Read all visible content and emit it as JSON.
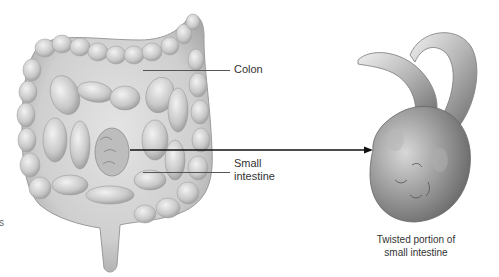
{
  "figure": {
    "labels": {
      "colon": "Colon",
      "small_intestine_line1": "Small",
      "small_intestine_line2": "intestine"
    },
    "caption": {
      "line1": "Twisted portion of",
      "line2": "small intestine"
    },
    "edge_fragment": "s"
  }
}
